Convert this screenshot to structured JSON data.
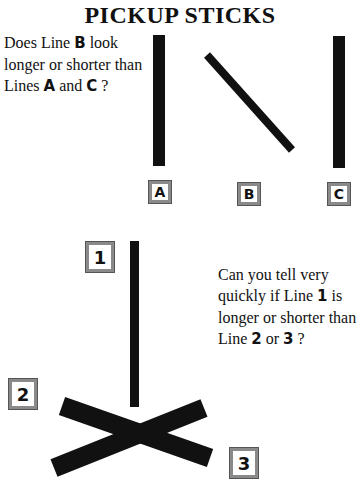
{
  "title": "PICKUP STICKS",
  "puzzle1": {
    "question_parts": [
      "Does Line ",
      "B",
      " look longer or shorter than Lines ",
      "A",
      " and ",
      "C",
      " ?"
    ],
    "labels": [
      "A",
      "B",
      "C"
    ]
  },
  "puzzle2": {
    "question_parts": [
      "Can you tell very quickly if Line ",
      "1",
      " is longer or shorter than Line ",
      "2",
      " or ",
      "3",
      " ?"
    ],
    "labels": [
      "1",
      "2",
      "3"
    ]
  },
  "colors": {
    "stick": "#111111",
    "label_border": "#8a8a8a"
  }
}
